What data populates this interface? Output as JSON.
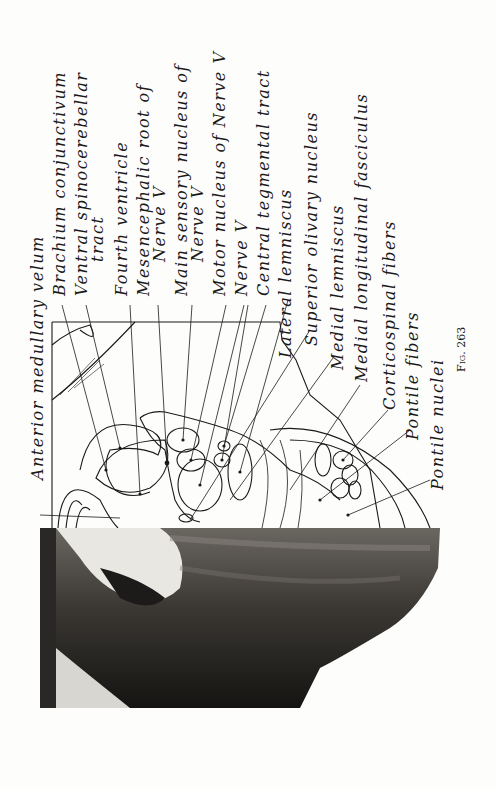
{
  "figure": {
    "caption": "Fig. 263",
    "labels": [
      {
        "text": "Anterior medullary velum",
        "x": 30,
        "y": 480
      },
      {
        "text": "Brachium conjunctivum",
        "x": 52,
        "y": 296
      },
      {
        "text": "Ventral spinocerebellar",
        "x": 74,
        "y": 296
      },
      {
        "text": "tract",
        "x": 90,
        "y": 262
      },
      {
        "text": "Fourth ventricle",
        "x": 114,
        "y": 296
      },
      {
        "text": "Mesencephalic root of",
        "x": 136,
        "y": 296
      },
      {
        "text": "Nerve V",
        "x": 152,
        "y": 262
      },
      {
        "text": "Main sensory nucleus of",
        "x": 174,
        "y": 296
      },
      {
        "text": "Nerve V",
        "x": 190,
        "y": 262
      },
      {
        "text": "Motor nucleus of Nerve V",
        "x": 212,
        "y": 296
      },
      {
        "text": "Nerve V",
        "x": 234,
        "y": 296
      },
      {
        "text": "Central tegmental tract",
        "x": 256,
        "y": 296
      },
      {
        "text": "Lateral lemniscus",
        "x": 278,
        "y": 358
      },
      {
        "text": "Superior olivary nucleus",
        "x": 304,
        "y": 346
      },
      {
        "text": "Medial lemniscus",
        "x": 330,
        "y": 370
      },
      {
        "text": "Medial longitudinal fasciculus",
        "x": 354,
        "y": 382
      },
      {
        "text": "Corticospinal fibers",
        "x": 382,
        "y": 410
      },
      {
        "text": "Pontile fibers",
        "x": 405,
        "y": 440
      },
      {
        "text": "Pontile nuclei",
        "x": 430,
        "y": 490
      }
    ]
  }
}
